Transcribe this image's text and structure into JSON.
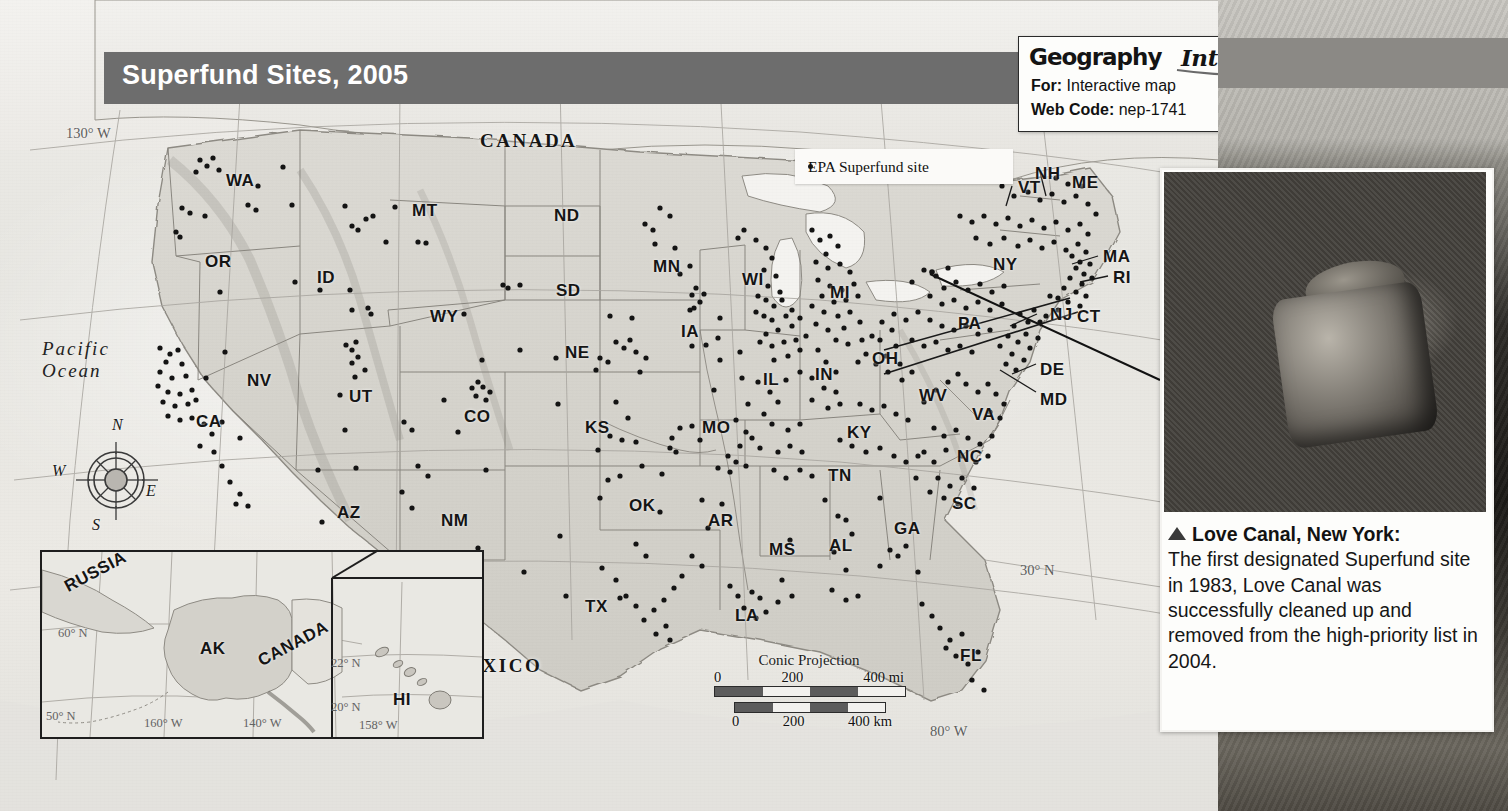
{
  "title": "Superfund Sites, 2005",
  "geography_interactive": {
    "logo_word1": "Geography",
    "logo_word2": "Interactive",
    "for_label": "For:",
    "for_value": "Interactive map",
    "code_label": "Web Code:",
    "code_value": "nep-1741"
  },
  "legend": {
    "marker": "dot",
    "label": "EPA Superfund site"
  },
  "photo_caption": {
    "title": "Love Canal, New York:",
    "body": "The first designated Superfund site in 1983, Love Canal was successfully cleaned up and removed from the high-priority list in 2004."
  },
  "map": {
    "callout": {
      "line1": "Love",
      "line2": "Canal"
    },
    "countries": [
      {
        "name": "CANADA",
        "x": 480,
        "y": 130
      },
      {
        "name": "MEXICO",
        "x": 447,
        "y": 655
      }
    ],
    "ocean": {
      "line1": "Pacific",
      "line2": "Ocean",
      "x": 42,
      "y": 338
    },
    "graticules": [
      {
        "label": "130° W",
        "x": 66,
        "y": 125
      },
      {
        "label": "30° N",
        "x": 1020,
        "y": 562
      },
      {
        "label": "80° W",
        "x": 930,
        "y": 723
      }
    ],
    "states": [
      {
        "code": "WA",
        "x": 226,
        "y": 171
      },
      {
        "code": "OR",
        "x": 205,
        "y": 252
      },
      {
        "code": "ID",
        "x": 317,
        "y": 268
      },
      {
        "code": "MT",
        "x": 412,
        "y": 201
      },
      {
        "code": "WY",
        "x": 430,
        "y": 307
      },
      {
        "code": "ND",
        "x": 554,
        "y": 206
      },
      {
        "code": "SD",
        "x": 556,
        "y": 281
      },
      {
        "code": "NE",
        "x": 565,
        "y": 343
      },
      {
        "code": "MN",
        "x": 653,
        "y": 257
      },
      {
        "code": "IA",
        "x": 681,
        "y": 322
      },
      {
        "code": "WI",
        "x": 742,
        "y": 270
      },
      {
        "code": "MI",
        "x": 830,
        "y": 283
      },
      {
        "code": "IL",
        "x": 763,
        "y": 370
      },
      {
        "code": "IN",
        "x": 815,
        "y": 365
      },
      {
        "code": "OH",
        "x": 872,
        "y": 349
      },
      {
        "code": "NV",
        "x": 247,
        "y": 371
      },
      {
        "code": "UT",
        "x": 349,
        "y": 387
      },
      {
        "code": "CO",
        "x": 464,
        "y": 407
      },
      {
        "code": "CA",
        "x": 196,
        "y": 412
      },
      {
        "code": "AZ",
        "x": 337,
        "y": 503
      },
      {
        "code": "NM",
        "x": 441,
        "y": 511
      },
      {
        "code": "KS",
        "x": 585,
        "y": 418
      },
      {
        "code": "MO",
        "x": 702,
        "y": 418
      },
      {
        "code": "KY",
        "x": 847,
        "y": 423
      },
      {
        "code": "TN",
        "x": 828,
        "y": 466
      },
      {
        "code": "OK",
        "x": 629,
        "y": 496
      },
      {
        "code": "AR",
        "x": 708,
        "y": 511
      },
      {
        "code": "TX",
        "x": 585,
        "y": 597
      },
      {
        "code": "LA",
        "x": 735,
        "y": 606
      },
      {
        "code": "MS",
        "x": 769,
        "y": 540
      },
      {
        "code": "AL",
        "x": 829,
        "y": 536
      },
      {
        "code": "GA",
        "x": 894,
        "y": 519
      },
      {
        "code": "SC",
        "x": 952,
        "y": 494
      },
      {
        "code": "NC",
        "x": 957,
        "y": 447
      },
      {
        "code": "VA",
        "x": 972,
        "y": 405
      },
      {
        "code": "WV",
        "x": 919,
        "y": 386
      },
      {
        "code": "PA",
        "x": 958,
        "y": 314
      },
      {
        "code": "NY",
        "x": 993,
        "y": 255
      },
      {
        "code": "VT",
        "x": 1018,
        "y": 178
      },
      {
        "code": "NH",
        "x": 1035,
        "y": 164
      },
      {
        "code": "ME",
        "x": 1072,
        "y": 173
      },
      {
        "code": "MA",
        "x": 1103,
        "y": 247
      },
      {
        "code": "RI",
        "x": 1113,
        "y": 268
      },
      {
        "code": "CT",
        "x": 1077,
        "y": 307
      },
      {
        "code": "NJ",
        "x": 1050,
        "y": 305
      },
      {
        "code": "DE",
        "x": 1040,
        "y": 360
      },
      {
        "code": "MD",
        "x": 1040,
        "y": 390
      },
      {
        "code": "FL",
        "x": 960,
        "y": 646
      }
    ]
  },
  "inset": {
    "labels": [
      {
        "text": "RUSSIA",
        "x": 60,
        "y": 560
      },
      {
        "text": "AK",
        "x": 198,
        "y": 637
      },
      {
        "text": "CANADA",
        "x": 253,
        "y": 632
      },
      {
        "text": "HI",
        "x": 391,
        "y": 688
      }
    ],
    "graticules": [
      {
        "text": "60° N",
        "x": 56,
        "y": 624
      },
      {
        "text": "50° N",
        "x": 44,
        "y": 707
      },
      {
        "text": "160° W",
        "x": 142,
        "y": 714
      },
      {
        "text": "140° W",
        "x": 241,
        "y": 714
      },
      {
        "text": "22° N",
        "x": 329,
        "y": 654
      },
      {
        "text": "20° N",
        "x": 329,
        "y": 698
      },
      {
        "text": "158° W",
        "x": 357,
        "y": 716
      }
    ]
  },
  "scale": {
    "projection": "Conic Projection",
    "miles": {
      "ticks": [
        "0",
        "200",
        "400 mi"
      ]
    },
    "km": {
      "ticks": [
        "0",
        "200",
        "400 km"
      ]
    }
  },
  "compass": {
    "n": "N",
    "e": "E",
    "s": "S",
    "w": "W"
  },
  "colors": {
    "banner": "#6d6d6d",
    "land": "#d8d6d0",
    "dot": "#141414",
    "paper": "#e8e7e2"
  }
}
